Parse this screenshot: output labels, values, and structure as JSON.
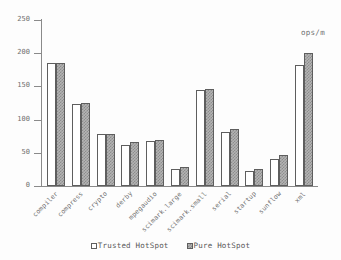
{
  "unit_annotation": "ops/m",
  "legend": {
    "entries": [
      {
        "label": "Trusted HotSpot",
        "swatch": "empty-square-swatch",
        "color": "#ffffff"
      },
      {
        "label": "Pure HotSpot",
        "swatch": "hatched-square-swatch",
        "color": "#b4b4b4"
      }
    ]
  },
  "y_axis": {
    "ticks": [
      {
        "label": "250",
        "value": 250
      },
      {
        "label": "200",
        "value": 200
      },
      {
        "label": "150",
        "value": 150
      },
      {
        "label": "100",
        "value": 100
      },
      {
        "label": "50",
        "value": 50
      },
      {
        "label": "0",
        "value": 0
      }
    ]
  },
  "chart_data": {
    "type": "bar",
    "title": "",
    "subtitle": "",
    "xlabel": "",
    "ylabel": "ops/m",
    "ylim": [
      0,
      250
    ],
    "ytick_step": 50,
    "grid": false,
    "legend_position": "bottom-center",
    "categories": [
      "compiler",
      "compress",
      "crypto",
      "derby",
      "mpegaudio",
      "scimark.large",
      "scimark.small",
      "serial",
      "startup",
      "sunflow",
      "xml"
    ],
    "series": [
      {
        "name": "Trusted HotSpot",
        "fill": "white",
        "values": [
          185,
          123,
          78,
          62,
          68,
          26,
          144,
          82,
          22,
          41,
          183
        ]
      },
      {
        "name": "Pure HotSpot",
        "fill": "hatched-gray",
        "values": [
          185,
          125,
          78,
          66,
          70,
          28,
          146,
          86,
          26,
          47,
          201
        ]
      }
    ]
  }
}
